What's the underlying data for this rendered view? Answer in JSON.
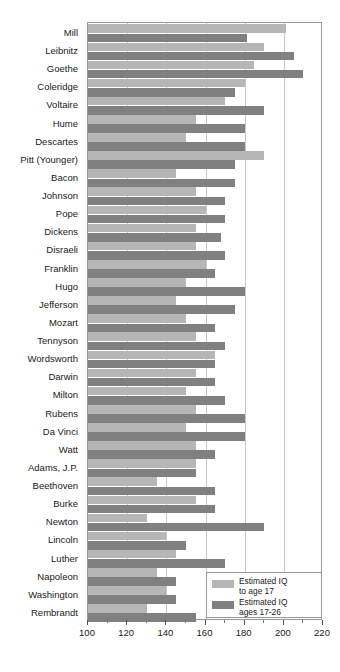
{
  "chart_data": {
    "type": "bar",
    "orientation": "horizontal",
    "title": "",
    "xlabel": "",
    "ylabel": "",
    "xlim": [
      100,
      220
    ],
    "xticks": [
      100,
      120,
      140,
      160,
      180,
      200,
      220
    ],
    "xtick_labels": [
      "100",
      "120",
      "140",
      "160",
      "180",
      "200",
      "220"
    ],
    "minor_tick_step": 10,
    "grid": true,
    "grid_axis": "x",
    "legend_position": "bottom-right",
    "categories": [
      "Mill",
      "Leibnitz",
      "Goethe",
      "Coleridge",
      "Voltaire",
      "Hume",
      "Descartes",
      "Pitt (Younger)",
      "Bacon",
      "Johnson",
      "Pope",
      "Dickens",
      "Disraeli",
      "Franklin",
      "Hugo",
      "Jefferson",
      "Mozart",
      "Tennyson",
      "Wordsworth",
      "Darwin",
      "Milton",
      "Rubens",
      "Da Vinci",
      "Watt",
      "Adams, J.P.",
      "Beethoven",
      "Burke",
      "Newton",
      "Lincoln",
      "Luther",
      "Napoleon",
      "Washington",
      "Rembrandt"
    ],
    "series": [
      {
        "name": "Estimated IQ to age 17",
        "color": "#b6b6b6",
        "values": [
          201,
          190,
          185,
          180,
          170,
          155,
          150,
          190,
          145,
          155,
          160,
          155,
          155,
          160,
          150,
          145,
          150,
          155,
          165,
          155,
          150,
          155,
          150,
          155,
          155,
          135,
          155,
          130,
          140,
          145,
          135,
          140,
          130
        ]
      },
      {
        "name": "Estimated IQ ages 17-26",
        "color": "#808080",
        "values": [
          181,
          205,
          210,
          175,
          190,
          180,
          180,
          175,
          175,
          170,
          170,
          168,
          170,
          165,
          180,
          175,
          165,
          170,
          165,
          165,
          170,
          180,
          180,
          165,
          155,
          165,
          165,
          190,
          150,
          170,
          145,
          145,
          155
        ]
      }
    ]
  },
  "legend": {
    "entries": [
      {
        "label": "Estimated IQ\nto age 17",
        "color": "#b6b6b6"
      },
      {
        "label": "Estimated IQ\nages 17-26",
        "color": "#808080"
      }
    ]
  }
}
